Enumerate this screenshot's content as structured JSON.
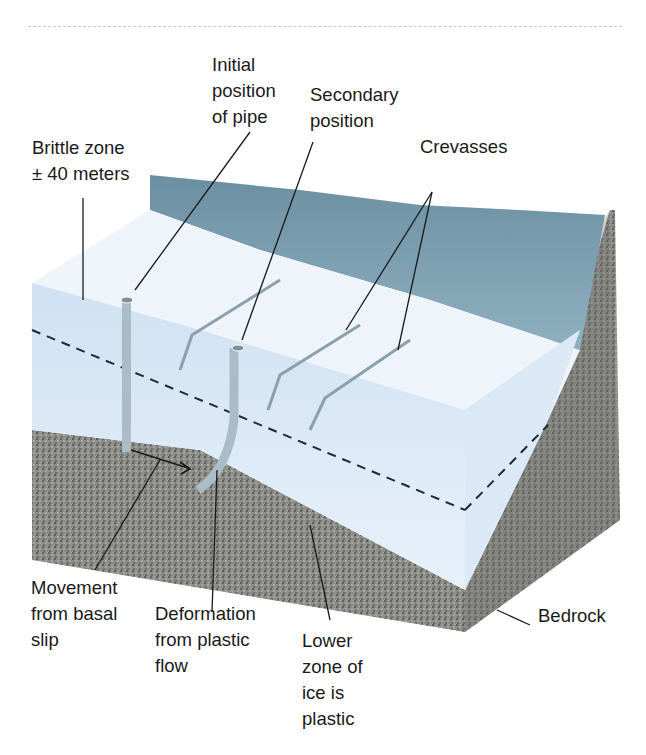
{
  "figure": {
    "colors": {
      "ice_front": "#dce9f6",
      "ice_top": "#eef4fa",
      "ice_side": "#cde0f3",
      "ice_far": "#6f94a6",
      "bedrock": "#8a8a86",
      "bedrock_dark": "#5e5e5a",
      "line": "#1a1a1a",
      "pipe": "#a9bcc8"
    }
  },
  "labels": {
    "initial_position": "Initial\nposition\nof pipe",
    "secondary_position": "Secondary\nposition",
    "brittle_zone": "Brittle zone\n± 40 meters",
    "crevasses": "Crevasses",
    "movement": "Movement\nfrom basal\nslip",
    "deformation": "Deformation\nfrom plastic\nflow",
    "lower_zone": "Lower\nzone of\nice is\nplastic",
    "bedrock": "Bedrock"
  }
}
